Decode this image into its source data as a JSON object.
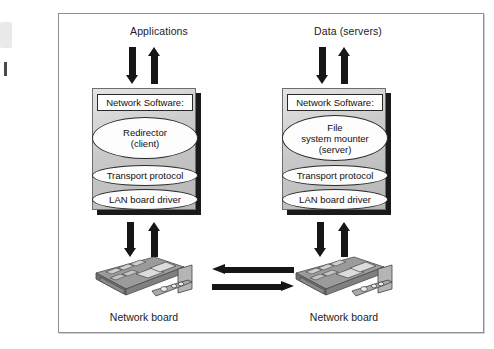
{
  "figure": {
    "frame_color": "#8f8f8f",
    "background": "#ffffff",
    "arrow_color": "#161616",
    "box_fill": "#c9c9c9",
    "ellipse_fill": "#fdfdfd"
  },
  "top_captions": {
    "left": "Applications",
    "right": "Data (servers)"
  },
  "stacks": [
    {
      "id": "client",
      "title": "Network Software:",
      "layers": [
        {
          "name": "redirector",
          "shape": "ellipse-large",
          "lines": [
            "Redirector",
            "(client)"
          ]
        },
        {
          "name": "transport-protocol",
          "shape": "ellipse-slim",
          "lines": [
            "Transport protocol"
          ]
        },
        {
          "name": "lan-board-driver",
          "shape": "ellipse-slim",
          "lines": [
            "LAN board driver"
          ]
        }
      ]
    },
    {
      "id": "server",
      "title": "Network Software:",
      "layers": [
        {
          "name": "file-system-mounter",
          "shape": "ellipse-large",
          "lines": [
            "File",
            "system mounter",
            "(server)"
          ]
        },
        {
          "name": "transport-protocol",
          "shape": "ellipse-slim",
          "lines": [
            "Transport protocol"
          ]
        },
        {
          "name": "lan-board-driver",
          "shape": "ellipse-slim",
          "lines": [
            "LAN board driver"
          ]
        }
      ]
    }
  ],
  "board_labels": {
    "left": "Network board",
    "right": "Network board"
  },
  "arrows": {
    "top_left_down": "down-arrow",
    "top_left_up": "up-arrow",
    "top_right_down": "down-arrow",
    "top_right_up": "up-arrow",
    "bottom_left_down": "down-arrow",
    "bottom_left_up": "up-arrow",
    "bottom_right_down": "down-arrow",
    "bottom_right_up": "up-arrow",
    "link_upper": "left-arrow",
    "link_lower": "right-arrow"
  }
}
